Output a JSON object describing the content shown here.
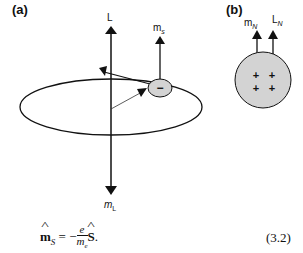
{
  "panels": {
    "a": {
      "label": "(a)"
    },
    "b": {
      "label": "(b)"
    }
  },
  "vectors": {
    "L": "L",
    "m_s": {
      "base": "m",
      "sub": "s"
    },
    "m_L": {
      "base": "m",
      "sub": "L"
    },
    "m_N": {
      "base": "m",
      "sub": "N"
    },
    "L_N": {
      "base": "L",
      "sub": "N"
    }
  },
  "symbols": {
    "electron_charge": "−",
    "nucleus_charges": [
      "+",
      "+",
      "+",
      "+"
    ]
  },
  "colors": {
    "line": "#111111",
    "particle_fill": "#d3d3d3"
  },
  "equation": {
    "lhs_base": "m",
    "lhs_sub": "S",
    "equals": "=",
    "minus": "−",
    "numerator": "e",
    "denominator": "m",
    "denominator_sub": "e",
    "rhs": "S",
    "period": ".",
    "number": "(3.2)"
  }
}
